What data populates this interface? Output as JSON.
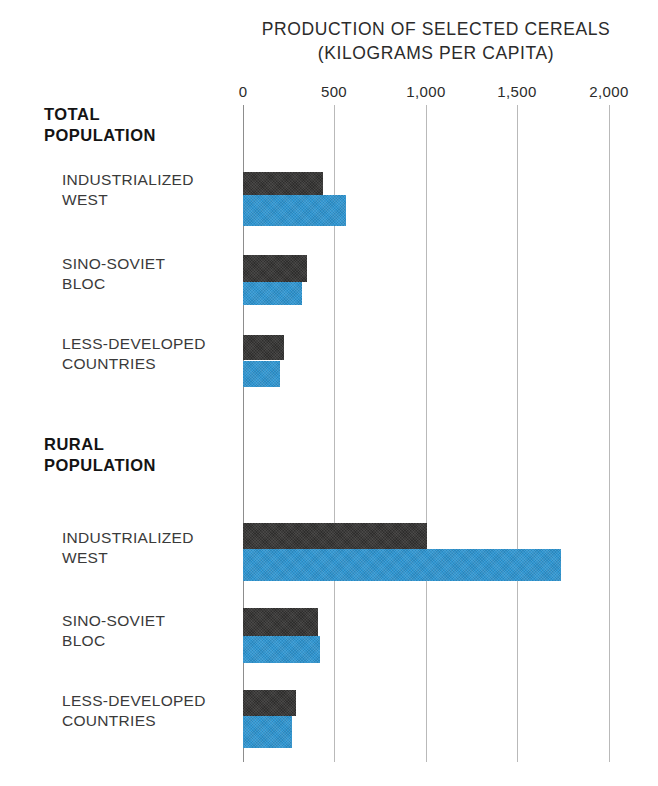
{
  "chart_data": {
    "type": "bar",
    "orientation": "horizontal",
    "title": "PRODUCTION OF SELECTED CEREALS",
    "subtitle": "(KILOGRAMS PER CAPITA)",
    "xlabel": "",
    "ylabel": "",
    "xlim": [
      0,
      2000
    ],
    "grid": true,
    "legend_position": "none",
    "tick_labels": [
      "0",
      "500",
      "1,000",
      "1,500",
      "2,000"
    ],
    "tick_values": [
      0,
      500,
      1000,
      1500,
      2000
    ],
    "series": [
      {
        "name": "dark-series",
        "color": "#3b3a39"
      },
      {
        "name": "blue-series",
        "color": "#2f96d2"
      }
    ],
    "groups": [
      {
        "heading": "TOTAL\nPOPULATION",
        "categories": [
          {
            "label": "INDUSTRIALIZED\nWEST",
            "dark": 435,
            "blue": 555
          },
          {
            "label": "SINO-SOVIET\nBLOC",
            "dark": 345,
            "blue": 320
          },
          {
            "label": "LESS-DEVELOPED\nCOUNTRIES",
            "dark": 220,
            "blue": 198
          }
        ]
      },
      {
        "heading": "RURAL\nPOPULATION",
        "categories": [
          {
            "label": "INDUSTRIALIZED\nWEST",
            "dark": 995,
            "blue": 1720
          },
          {
            "label": "SINO-SOVIET\nBLOC",
            "dark": 405,
            "blue": 418
          },
          {
            "label": "LESS-DEVELOPED\nCOUNTRIES",
            "dark": 285,
            "blue": 264
          }
        ]
      }
    ]
  },
  "labels": {
    "title": "PRODUCTION OF SELECTED CEREALS",
    "subtitle": "(KILOGRAMS PER CAPITA)",
    "tick0": "0",
    "tick1": "500",
    "tick2": "1,000",
    "tick3": "1,500",
    "tick4": "2,000",
    "group_total": "TOTAL\nPOPULATION",
    "group_rural": "RURAL\nPOPULATION",
    "cat_west": "INDUSTRIALIZED\nWEST",
    "cat_sino": "SINO-SOVIET\nBLOC",
    "cat_less": "LESS-DEVELOPED\nCOUNTRIES"
  },
  "colors": {
    "dark_bar": "#3b3a39",
    "blue_bar": "#2f96d2",
    "gridline": "#b9b9b9",
    "text": "#2b2b2b"
  }
}
